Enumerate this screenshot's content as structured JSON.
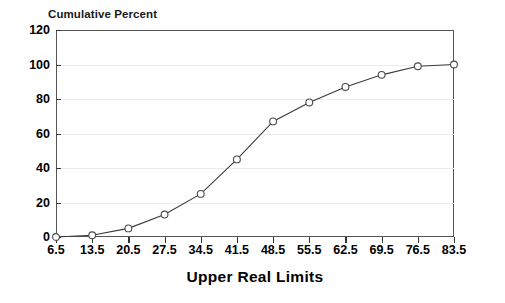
{
  "chart_data": {
    "type": "line",
    "title": "Cumulative Percent",
    "xlabel": "Upper Real Limits",
    "ylabel": "",
    "x": [
      6.5,
      13.5,
      20.5,
      27.5,
      34.5,
      41.5,
      48.5,
      55.5,
      62.5,
      69.5,
      76.5,
      83.5
    ],
    "categories": [
      "6.5",
      "13.5",
      "20.5",
      "27.5",
      "34.5",
      "41.5",
      "48.5",
      "55.5",
      "62.5",
      "69.5",
      "76.5",
      "83.5"
    ],
    "values": [
      0,
      1,
      5,
      13,
      25,
      45,
      67,
      78,
      87,
      94,
      99,
      100
    ],
    "xlim": [
      6.5,
      83.5
    ],
    "ylim": [
      0,
      120
    ],
    "yticks": [
      0,
      20,
      40,
      60,
      80,
      100,
      120
    ],
    "ytick_labels": [
      "0",
      "20",
      "40",
      "60",
      "80",
      "100",
      "120"
    ],
    "xtick_labels": [
      "6.5",
      "13.5",
      "20.5",
      "27.5",
      "34.5",
      "41.5",
      "48.5",
      "55.5",
      "62.5",
      "69.5",
      "76.5",
      "83.5"
    ],
    "grid": true,
    "grid_axis": "y",
    "legend": false,
    "marker": "circle-open",
    "line_color": "#3a3a3a",
    "marker_fill": "#ffffff",
    "marker_edge_color": "#4a4a4a",
    "grid_color": "#ebebeb",
    "frame_color": "#555555",
    "background_color": "#ffffff"
  }
}
